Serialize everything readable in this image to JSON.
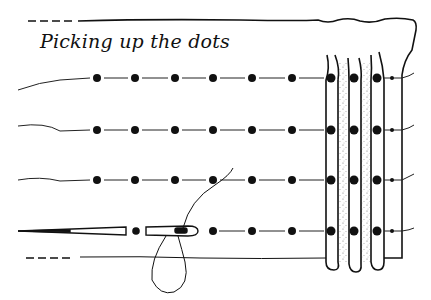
{
  "diagram": {
    "title": "Picking up the dots",
    "colors": {
      "ink": "#111111",
      "background": "#ffffff",
      "stipple": "#888888"
    },
    "rows": [
      {
        "y": 78
      },
      {
        "y": 130
      },
      {
        "y": 180
      },
      {
        "y": 232
      }
    ],
    "dot_columns_x": [
      97,
      135,
      175,
      213,
      252,
      292
    ],
    "pleat_dots_x": [
      331,
      354,
      377
    ],
    "small_dot_x": 392,
    "needle": {
      "tip_x": 18,
      "eye_x": 195,
      "y": 230
    },
    "labels": {
      "needle": "needle-icon",
      "thread": "thread-loop",
      "pleats": "gathered-pleats"
    }
  }
}
